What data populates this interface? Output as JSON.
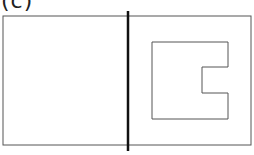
{
  "figure": {
    "label": "(c)",
    "colors": {
      "stroke": "#555555",
      "divider": "#111111",
      "background": "#ffffff"
    },
    "outer_rect": {
      "x": 3,
      "y": 16,
      "w": 248,
      "h": 129
    },
    "divider": {
      "x": 128,
      "y1": 11,
      "y2": 151
    },
    "inner_shape": {
      "points": "152,42 228,42 228,67 202,67 202,93 228,93 228,119 152,119"
    }
  }
}
